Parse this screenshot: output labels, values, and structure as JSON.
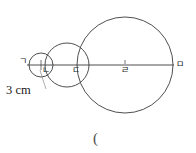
{
  "figure": {
    "background_color": "#ffffff",
    "stroke_color": "#3b3b3b",
    "text_color": "#1a1a1a",
    "width": 196,
    "height": 153,
    "baseline_y": 65,
    "dimension": {
      "text": "3 cm",
      "x": 6,
      "y": 84
    },
    "trailing_paren": {
      "text": "(",
      "x": 93,
      "y": 131
    },
    "points": [
      {
        "label": "ㄱ",
        "x": 30,
        "y": 65,
        "label_x": 19,
        "label_y": 57,
        "name": "point-giyeok"
      },
      {
        "label": "ㄴ",
        "x": 41,
        "y": 65,
        "label_x": 42,
        "label_y": 66,
        "name": "point-nieun"
      },
      {
        "label": "ㄷ",
        "x": 78,
        "y": 65,
        "label_x": 72,
        "label_y": 66,
        "name": "point-digeut"
      },
      {
        "label": "ㄹ",
        "x": 125,
        "y": 65,
        "label_x": 121,
        "label_y": 66,
        "name": "point-rieul"
      },
      {
        "label": "ㅁ",
        "x": 173,
        "y": 65,
        "label_x": 176,
        "label_y": 60,
        "name": "point-mieum"
      }
    ],
    "circles": [
      {
        "name": "circle-small",
        "cx": 41,
        "cy": 65,
        "r": 12
      },
      {
        "name": "circle-medium",
        "cx": 67,
        "cy": 65,
        "r": 22
      },
      {
        "name": "circle-large",
        "cx": 125,
        "cy": 65,
        "r": 48
      }
    ],
    "baseline": {
      "name": "diameter-line",
      "x1": 27,
      "y1": 65,
      "x2": 174,
      "y2": 65
    },
    "leader": {
      "name": "leader-line",
      "d": "M 46 89 C 44 83 42 77 40 70"
    },
    "tick_marks": [
      {
        "name": "center-tick-nieun",
        "x": 41,
        "y": 65
      },
      {
        "name": "center-tick-rieul",
        "x": 125,
        "y": 62
      }
    ]
  }
}
